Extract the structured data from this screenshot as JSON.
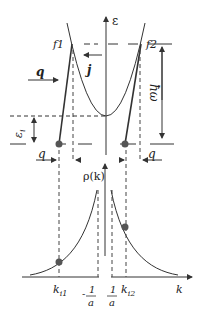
{
  "top_panel": {
    "axis_label": "ε",
    "point_f1": "f1",
    "point_f2": "f2",
    "current_label": "j",
    "wavevector_left": "q",
    "wavevector_right": "q",
    "wavevector_bottom_left": "q",
    "energy_level_label": "ε",
    "energy_level_subscript": "i",
    "photon_energy_label": "ħω"
  },
  "bottom_panel": {
    "axis_label": "ρ(k)",
    "x_axis_label": "k",
    "tick_ki1": "k",
    "tick_ki1_sub": "i1",
    "tick_ki2": "k",
    "tick_ki2_sub": "i2",
    "tick_neg_inv_a_num": "1",
    "tick_neg_inv_a_den": "a",
    "tick_neg_sign": "-",
    "tick_pos_inv_a_num": "1",
    "tick_pos_inv_a_den": "a"
  },
  "colors": {
    "line": "#333333",
    "dot": "#555555"
  }
}
